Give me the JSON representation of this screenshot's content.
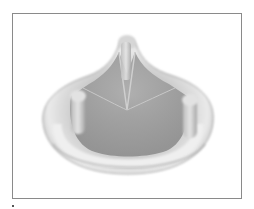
{
  "figure": {
    "alt": "Photograph of a bioprosthetic mitral heart valve with sewing ring and stent posts",
    "colors": {
      "frame_border": "#8a8a8a",
      "ring_light": "#e6e6e6",
      "ring_shadow": "#9a9a9a",
      "leaflet": "#a4a4a4",
      "background": "#ffffff"
    }
  }
}
